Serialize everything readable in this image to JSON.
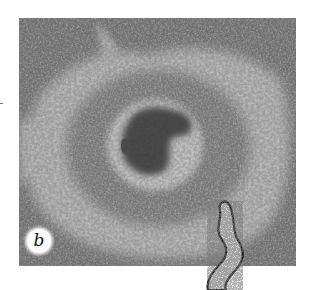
{
  "figure": {
    "panel_label": "b",
    "colors": {
      "background": "#ffffff",
      "outer_field": "#6e6e6e",
      "light_ring": "#d8d8d8",
      "dark_ring": "#7a7a7a",
      "inner_halo": "#e4e4e4",
      "center_mass": "#202020",
      "worm_fill": "#d9d9d9",
      "worm_outline": "#111111"
    }
  }
}
